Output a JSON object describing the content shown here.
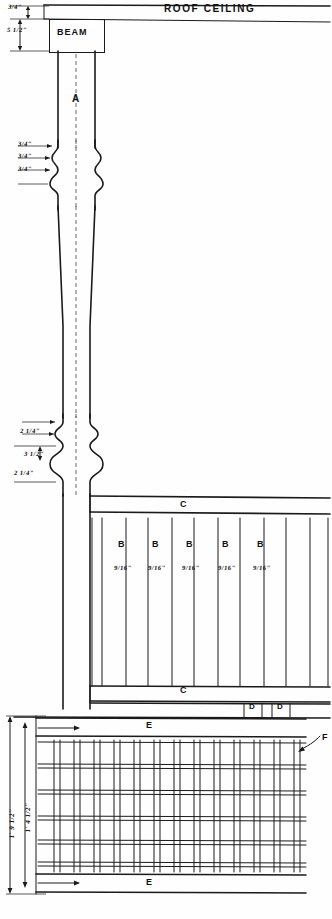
{
  "drawing": {
    "title": "ROOF CEILING",
    "ink_color": "#1a1a1a",
    "paper_color": "#fefefe"
  },
  "header": {
    "roof_ceiling_label": "ROOF CEILING",
    "beam_label": "BEAM"
  },
  "parts": {
    "post": "A",
    "baluster": "B",
    "rail": "C",
    "block": "D",
    "lattice_frame": "E",
    "lattice_strip": "F"
  },
  "balusters": [
    {
      "part": "B",
      "size": "9/16\""
    },
    {
      "part": "B",
      "size": "9/16\""
    },
    {
      "part": "B",
      "size": "9/16\""
    },
    {
      "part": "B",
      "size": "9/16\""
    },
    {
      "part": "B",
      "size": "9/16\""
    }
  ],
  "rails": {
    "top_label": "C",
    "bottom_label": "D"
  },
  "rail_labels": {
    "top": "C",
    "bottom": "C"
  },
  "blocks": [
    {
      "label": "D"
    },
    {
      "label": "D"
    }
  ],
  "lattice": {
    "top_label": "E",
    "bottom_label": "E",
    "strip_callout": "F",
    "rows": 6,
    "columns": 13
  },
  "dimensions": {
    "beam_top": "3/4\"",
    "beam_height": "5 1/2\"",
    "post_detail_upper": [
      "3/4\"",
      "3/4\"",
      "3/4\""
    ],
    "post_detail_lower": [
      "2 1/4\"",
      "3 1/2\"",
      "2 1/4\""
    ],
    "lattice_overall_height": "1' 9 1/2\"",
    "lattice_inner_height": "1' 4 1/2\""
  },
  "callouts": {
    "f_leader": "F"
  }
}
